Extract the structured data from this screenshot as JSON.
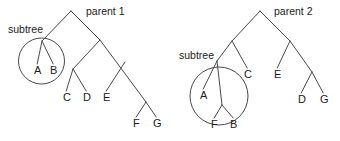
{
  "figure": {
    "title": "",
    "background_color": "#ffffff",
    "stroke_color": "#4a4a4a",
    "text_color": "#1b1b1b"
  },
  "trees": [
    {
      "id": "parent-1",
      "title": "parent 1",
      "title_pos": {
        "x": 86,
        "y": 15
      },
      "annotation": {
        "label": "subtree",
        "pos": {
          "x": 8,
          "y": 33
        }
      },
      "highlight_circle": {
        "cx": 41.5,
        "cy": 61,
        "r": 23
      },
      "nodes": [
        {
          "id": "root",
          "label": "",
          "x": 71,
          "y": 11
        },
        {
          "id": "n-sub",
          "label": "",
          "x": 42,
          "y": 41
        },
        {
          "id": "n-right",
          "label": "",
          "x": 100,
          "y": 40
        },
        {
          "id": "n-cd",
          "label": "",
          "x": 73,
          "y": 69
        },
        {
          "id": "n-e",
          "label": "",
          "x": 125,
          "y": 62
        },
        {
          "id": "n-fg",
          "label": "",
          "x": 146,
          "y": 102
        },
        {
          "id": "leaf-a",
          "label": "A",
          "x": 34,
          "y": 74
        },
        {
          "id": "leaf-b",
          "label": "B",
          "x": 50,
          "y": 74
        },
        {
          "id": "leaf-c",
          "label": "C",
          "x": 63,
          "y": 101
        },
        {
          "id": "leaf-d",
          "label": "D",
          "x": 83,
          "y": 101
        },
        {
          "id": "leaf-e",
          "label": "E",
          "x": 103,
          "y": 101
        },
        {
          "id": "leaf-f",
          "label": "F",
          "x": 133,
          "y": 127
        },
        {
          "id": "leaf-g",
          "label": "G",
          "x": 153,
          "y": 127
        }
      ],
      "edges": [
        [
          "root",
          "n-sub"
        ],
        [
          "root",
          "n-right"
        ],
        [
          "n-sub",
          "leaf-a"
        ],
        [
          "n-sub",
          "leaf-b"
        ],
        [
          "n-right",
          "n-cd"
        ],
        [
          "n-right",
          "n-fg"
        ],
        [
          "n-cd",
          "leaf-c"
        ],
        [
          "n-cd",
          "leaf-d"
        ],
        [
          "n-e",
          "leaf-e"
        ],
        [
          "n-fg",
          "leaf-f"
        ],
        [
          "n-fg",
          "leaf-g"
        ]
      ]
    },
    {
      "id": "parent-2",
      "title": "parent 2",
      "title_pos": {
        "x": 274,
        "y": 15
      },
      "annotation": {
        "label": "subtree",
        "pos": {
          "x": 179,
          "y": 59
        }
      },
      "highlight_circle": {
        "cx": 219,
        "cy": 96,
        "r": 29
      },
      "nodes": [
        {
          "id": "root",
          "label": "",
          "x": 260,
          "y": 11
        },
        {
          "id": "n-left",
          "label": "",
          "x": 232,
          "y": 41
        },
        {
          "id": "n-right",
          "label": "",
          "x": 290,
          "y": 41
        },
        {
          "id": "n-sub",
          "label": "",
          "x": 217,
          "y": 61
        },
        {
          "id": "n-fb",
          "label": "",
          "x": 222,
          "y": 105
        },
        {
          "id": "n-dg",
          "label": "",
          "x": 312,
          "y": 72
        },
        {
          "id": "leaf-a",
          "label": "A",
          "x": 200,
          "y": 99
        },
        {
          "id": "leaf-f",
          "label": "F",
          "x": 211,
          "y": 128
        },
        {
          "id": "leaf-b",
          "label": "B",
          "x": 230,
          "y": 128
        },
        {
          "id": "leaf-c",
          "label": "C",
          "x": 244,
          "y": 78
        },
        {
          "id": "leaf-e",
          "label": "E",
          "x": 274,
          "y": 78
        },
        {
          "id": "leaf-d",
          "label": "D",
          "x": 298,
          "y": 103
        },
        {
          "id": "leaf-g",
          "label": "G",
          "x": 320,
          "y": 103
        }
      ],
      "edges": [
        [
          "root",
          "n-left"
        ],
        [
          "root",
          "n-right"
        ],
        [
          "n-left",
          "n-sub"
        ],
        [
          "n-left",
          "leaf-c"
        ],
        [
          "n-sub",
          "leaf-a"
        ],
        [
          "n-sub",
          "n-fb"
        ],
        [
          "n-fb",
          "leaf-f"
        ],
        [
          "n-fb",
          "leaf-b"
        ],
        [
          "n-right",
          "leaf-e"
        ],
        [
          "n-right",
          "n-dg"
        ],
        [
          "n-dg",
          "leaf-d"
        ],
        [
          "n-dg",
          "leaf-g"
        ]
      ]
    }
  ]
}
